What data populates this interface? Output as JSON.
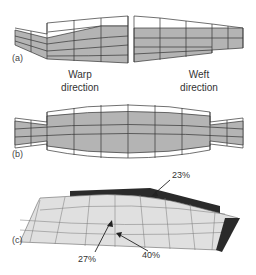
{
  "panels": {
    "a": {
      "label": "(a)",
      "captions": {
        "warp": "Warp\ndirection",
        "weft": "Weft\ndirection"
      },
      "warp_caption_lines": [
        "Warp",
        "direction"
      ],
      "weft_caption_lines": [
        "Weft",
        "direction"
      ]
    },
    "b": {
      "label": "(b)"
    },
    "c": {
      "label": "(c)",
      "annotations": [
        "23%",
        "27%",
        "40%"
      ]
    }
  },
  "colors": {
    "fill": "#b4b4b4",
    "stroke": "#333333",
    "dark": "#2a2a2a",
    "light": "#e6e6e6"
  }
}
